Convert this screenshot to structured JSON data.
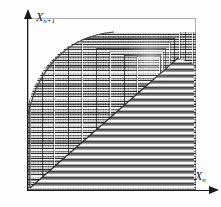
{
  "figure": {
    "kind": "phase-plot",
    "background_color": "#fdfdfd",
    "ink_color": "#1a1a1a"
  },
  "axes": {
    "y": {
      "label_base": "X",
      "label_sub": "n+1",
      "name": "y-axis",
      "arrow": "up"
    },
    "x": {
      "label_base": "X",
      "label_sub": "n",
      "name": "x-axis",
      "arrow": "right"
    },
    "origin_px": [
      28,
      190
    ]
  },
  "chart_data": {
    "type": "scatter",
    "title": "",
    "xlabel": "X_n",
    "ylabel": "X_n+1",
    "xlim": [
      0,
      1
    ],
    "ylim": [
      0,
      1
    ],
    "grid": false,
    "legend": null,
    "annotations": [
      "Dense self-similar nested-rectangle spiral converging to a fixed point",
      "Parabolic upper-left envelope boundary",
      "Horizontal striping dominant in lower-right wedge",
      "Cross-hatched vertical + horizontal grid in upper-left region"
    ],
    "features": {
      "vanishing_point_px": [
        150,
        58
      ],
      "plot_box_px": {
        "left": 28,
        "top": 18,
        "width": 168,
        "height": 172
      },
      "nested_rect_count": 9,
      "stripe_band_count": 26
    },
    "nested_rectangles": [
      {
        "left": 2,
        "top": 2,
        "width": 163,
        "height": 167
      },
      {
        "left": 14,
        "top": 8,
        "width": 144,
        "height": 156
      },
      {
        "left": 26,
        "top": 14,
        "width": 126,
        "height": 144
      },
      {
        "left": 40,
        "top": 20,
        "width": 107,
        "height": 131
      },
      {
        "left": 54,
        "top": 25,
        "width": 88,
        "height": 118
      },
      {
        "left": 68,
        "top": 30,
        "width": 70,
        "height": 104
      },
      {
        "left": 82,
        "top": 34,
        "width": 53,
        "height": 90
      },
      {
        "left": 96,
        "top": 37,
        "width": 37,
        "height": 74
      },
      {
        "left": 109,
        "top": 39,
        "width": 23,
        "height": 58
      }
    ],
    "stripe_rows_y": [
      58,
      62,
      66,
      70,
      74,
      78,
      82,
      86,
      90,
      94,
      98,
      102,
      106,
      110,
      114,
      118,
      122,
      126,
      130,
      134,
      138,
      144,
      150,
      156,
      162,
      168
    ]
  }
}
